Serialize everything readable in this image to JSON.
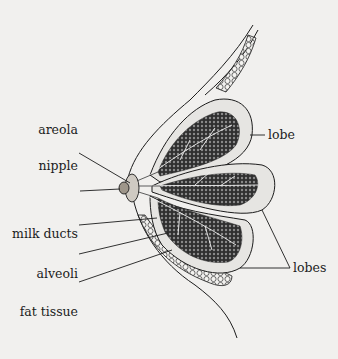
{
  "diagram": {
    "labels": {
      "areola": "areola",
      "nipple": "nipple",
      "milk_ducts": "milk ducts",
      "alveoli": "alveoli",
      "fat_tissue": "fat tissue",
      "lobe": "lobe",
      "lobes": "lobes"
    },
    "colors": {
      "background": "#f1f0ee",
      "ink": "#1c1c1c",
      "lobe_fill": "#e6e5e2",
      "alveoli_fill": "#3a3a3a"
    }
  }
}
